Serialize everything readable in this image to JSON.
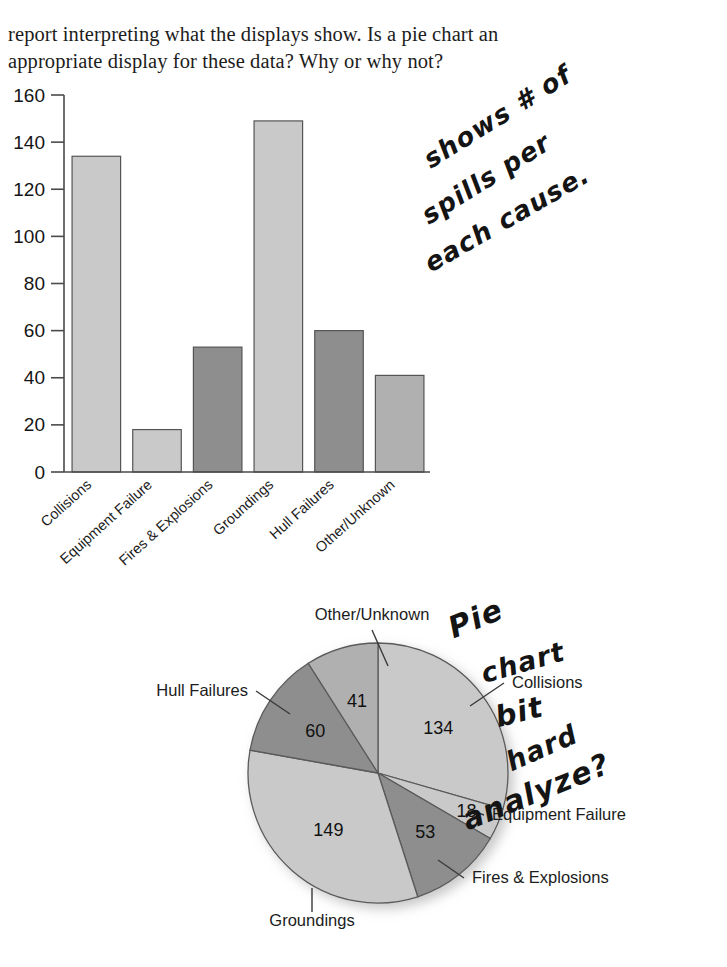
{
  "question": {
    "text": "report interpreting what the displays show. Is a pie chart an appropriate display for these data? Why or why not?"
  },
  "chart_data": [
    {
      "type": "bar",
      "title": "",
      "xlabel": "",
      "ylabel": "",
      "ylim": [
        0,
        160
      ],
      "yticks": [
        "0",
        "20",
        "40",
        "60",
        "80",
        "100",
        "120",
        "140",
        "160"
      ],
      "grid": false,
      "legend": "none",
      "categories": [
        "Collisions",
        "Equipment Failure",
        "Fires & Explosions",
        "Groundings",
        "Hull Failures",
        "Other/Unknown"
      ],
      "values": [
        134,
        18,
        53,
        149,
        60,
        41
      ],
      "bar_colors": [
        "#c9c9c9",
        "#c9c9c9",
        "#8e8e8e",
        "#c9c9c9",
        "#8e8e8e",
        "#b0b0b0"
      ]
    },
    {
      "type": "pie",
      "title": "",
      "legend": "callout-labels",
      "start_angle_deg": 0,
      "direction": "clockwise",
      "total": 455,
      "labels": [
        "Collisions",
        "Equipment Failure",
        "Fires & Explosions",
        "Groundings",
        "Hull Failures",
        "Other/Unknown"
      ],
      "values": [
        134,
        18,
        53,
        149,
        60,
        41
      ],
      "slice_colors": [
        "#c9c9c9",
        "#c9c9c9",
        "#8e8e8e",
        "#c9c9c9",
        "#8e8e8e",
        "#b0b0b0"
      ]
    }
  ],
  "annotations": {
    "bar_note": {
      "full_text": "shows # of spills per each cause.",
      "line1": "shows # of",
      "line2": "spills per",
      "line3": "each cause."
    },
    "pie_note": {
      "full_text": "Pie chart bit hard to analyze?",
      "line1": "Pie",
      "line2": "chart",
      "line3": "bit",
      "line4": "hard",
      "line5": "to",
      "line6": "analyze?"
    }
  },
  "colors": {
    "page_background": "#ffffff",
    "ink": "#141414",
    "axis": "#4a4a4a",
    "light_gray": "#c9c9c9",
    "medium_gray": "#b0b0b0",
    "dark_gray": "#8e8e8e"
  }
}
